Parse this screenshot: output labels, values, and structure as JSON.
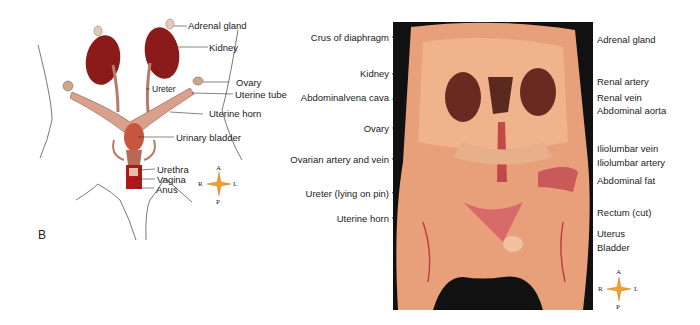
{
  "panel_b": {
    "letter": "B",
    "labels": {
      "adrenal_gland": "Adrenal gland",
      "kidney": "Kidney",
      "ovary": "Ovary",
      "uterine_tube": "Uterine tube",
      "ureter": "Ureter",
      "uterine_horn": "Uterine horn",
      "urinary_bladder": "Urinary bladder",
      "urethra": "Urethra",
      "vagina": "Vagina",
      "anus": "Anus"
    },
    "compass": {
      "a": "A",
      "p": "P",
      "r": "R",
      "l": "L"
    }
  },
  "photo_panel": {
    "left_labels": {
      "crus": "Crus of diaphragm",
      "kidney": "Kidney",
      "vena_cava": "Abdominalvena cava",
      "ovary": "Ovary",
      "ovarian": "Ovarian artery and vein",
      "ureter": "Ureter (lying on pin)",
      "uterine_horn": "Uterine horn"
    },
    "right_labels": {
      "adrenal": "Adrenal gland",
      "renal_artery": "Renal artery",
      "renal_vein": "Renal vein",
      "aorta": "Abdominal aorta",
      "iliolumbar_vein": "Iliolumbar vein",
      "iliolumbar_artery": "Iliolumbar artery",
      "fat": "Abdominal fat",
      "rectum": "Rectum (cut)",
      "uterus": "Uterus",
      "bladder": "Bladder"
    },
    "compass": {
      "a": "A",
      "p": "P",
      "r": "R",
      "l": "L"
    }
  },
  "colors": {
    "kidney": "#8b1a1a",
    "uterus": "#d9a08e",
    "bladder": "#c8553d",
    "tissue": "#e8a07a",
    "background_photo": "#111111"
  }
}
